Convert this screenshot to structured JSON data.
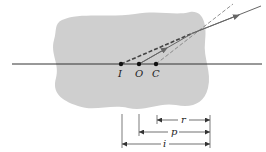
{
  "figure": {
    "colors": {
      "medium": "#cfcfcf",
      "axis": "#333333",
      "ray": "#666666",
      "dashed": "#555555",
      "points": "#111111"
    },
    "points": [
      {
        "id": "I",
        "label": "I"
      },
      {
        "id": "O",
        "label": "O"
      },
      {
        "id": "C",
        "label": "C"
      }
    ],
    "dimensions": [
      {
        "id": "r",
        "label": "r"
      },
      {
        "id": "p",
        "label": "p"
      },
      {
        "id": "i",
        "label": "i"
      }
    ]
  }
}
